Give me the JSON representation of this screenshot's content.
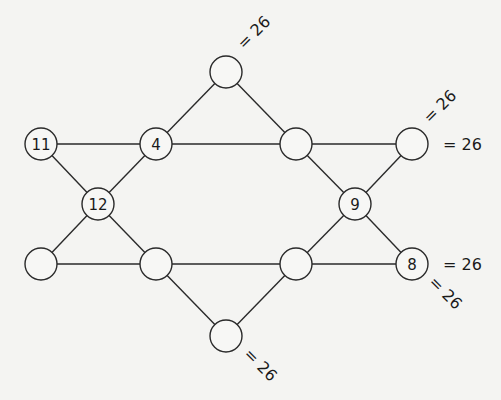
{
  "diagram": {
    "type": "magic-star-puzzle",
    "target_sum": "26",
    "node_radius": 16,
    "nodes": [
      {
        "id": "top",
        "x": 226,
        "y": 72,
        "value": ""
      },
      {
        "id": "r2c1",
        "x": 41,
        "y": 144,
        "value": "11"
      },
      {
        "id": "r2c2",
        "x": 156,
        "y": 144,
        "value": "4"
      },
      {
        "id": "r2c3",
        "x": 296,
        "y": 144,
        "value": ""
      },
      {
        "id": "r2c4",
        "x": 412,
        "y": 144,
        "value": ""
      },
      {
        "id": "mid-left",
        "x": 98,
        "y": 204,
        "value": "12"
      },
      {
        "id": "mid-right",
        "x": 355,
        "y": 204,
        "value": "9"
      },
      {
        "id": "r4c1",
        "x": 41,
        "y": 264,
        "value": ""
      },
      {
        "id": "r4c2",
        "x": 156,
        "y": 264,
        "value": ""
      },
      {
        "id": "r4c3",
        "x": 296,
        "y": 264,
        "value": ""
      },
      {
        "id": "r4c4",
        "x": 412,
        "y": 264,
        "value": "8"
      },
      {
        "id": "bottom",
        "x": 226,
        "y": 336,
        "value": ""
      }
    ],
    "lines": [
      {
        "name": "row-top",
        "path": [
          "r2c1",
          "r2c2",
          "r2c3",
          "r2c4"
        ]
      },
      {
        "name": "row-bottom",
        "path": [
          "r4c1",
          "r4c2",
          "r4c3",
          "r4c4"
        ]
      },
      {
        "name": "diag-a",
        "path": [
          "r2c1",
          "mid-left",
          "r4c2",
          "bottom"
        ]
      },
      {
        "name": "diag-b",
        "path": [
          "top",
          "r2c3",
          "mid-right",
          "r4c4"
        ]
      },
      {
        "name": "diag-c",
        "path": [
          "r4c1",
          "mid-left",
          "r2c2",
          "top"
        ]
      },
      {
        "name": "diag-d",
        "path": [
          "bottom",
          "r4c3",
          "mid-right",
          "r2c4"
        ]
      }
    ],
    "sum_labels": [
      {
        "text": "= 26",
        "x": 244,
        "y": 50,
        "rotate": -45
      },
      {
        "text": "= 26",
        "x": 430,
        "y": 124,
        "rotate": -45
      },
      {
        "text": "= 26",
        "x": 443,
        "y": 150,
        "rotate": 0
      },
      {
        "text": "= 26",
        "x": 443,
        "y": 270,
        "rotate": 0
      },
      {
        "text": "= 26",
        "x": 428,
        "y": 283,
        "rotate": 45
      },
      {
        "text": "= 26",
        "x": 243,
        "y": 355,
        "rotate": 45
      }
    ]
  }
}
